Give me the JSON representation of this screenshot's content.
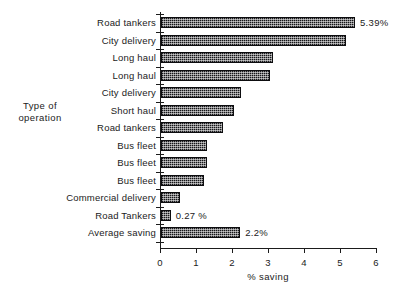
{
  "chart_data": {
    "type": "bar",
    "orientation": "horizontal",
    "title": "",
    "xlabel": "% saving",
    "ylabel": "Type of operation",
    "xlim": [
      0,
      6
    ],
    "ylim": null,
    "grid": false,
    "legend": null,
    "xticks": [
      "0",
      "1",
      "2",
      "3",
      "4",
      "5",
      "6"
    ],
    "xtick_values": [
      0,
      1,
      2,
      3,
      4,
      5,
      6
    ],
    "categories": [
      "Road tankers",
      "City  delivery",
      "Long haul",
      "Long haul",
      "City  delivery",
      "Short  haul",
      "Road tankers",
      "Bus fleet",
      "Bus fleet",
      "Bus fleet",
      "Commercial  delivery",
      "Road Tankers",
      "Average  saving"
    ],
    "values": [
      5.39,
      5.14,
      3.11,
      3.03,
      2.22,
      2.03,
      1.72,
      1.28,
      1.28,
      1.19,
      0.53,
      0.27,
      2.2
    ],
    "annotations": [
      {
        "index": 0,
        "text": "5.39%"
      },
      {
        "index": 11,
        "text": "0.27 %"
      },
      {
        "index": 12,
        "text": "2.2%"
      }
    ]
  },
  "axes": {
    "y_title_line1": "Type of",
    "y_title_line2": "operation",
    "x_title": "% saving"
  },
  "colors": {
    "bar_fill": "#17171a",
    "axis": "#1b1b1b",
    "background": "#ffffff",
    "text": "#1b1b1b"
  }
}
